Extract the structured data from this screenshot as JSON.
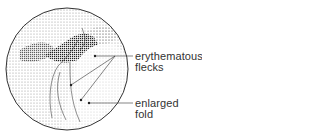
{
  "figure": {
    "type": "endoscopic-view-illustration",
    "labels": [
      {
        "id": "erythematous-flecks",
        "lines": [
          "erythematous",
          "flecks"
        ]
      },
      {
        "id": "enlarged-fold",
        "lines": [
          "enlarged",
          "fold"
        ]
      }
    ],
    "colors": {
      "ink": "#333333",
      "background": "#ffffff"
    }
  }
}
